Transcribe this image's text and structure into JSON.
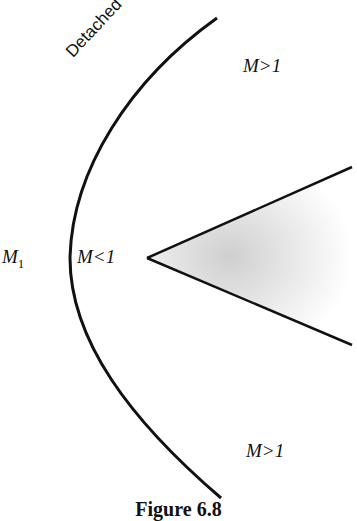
{
  "figure": {
    "caption": "Figure 6.8",
    "shock_label": "Detached shock",
    "labels": {
      "freestream": "M",
      "freestream_sub": "1",
      "subsonic": "M<1",
      "supersonic_top": "M>1",
      "supersonic_bottom": "M>1"
    },
    "colors": {
      "line": "#111111",
      "wedge_fill": "#d9d9d9"
    }
  }
}
